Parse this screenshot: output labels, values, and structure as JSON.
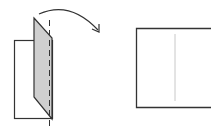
{
  "diagram": {
    "colors": {
      "stroke": "#333333",
      "panel_fill": "#cfcfcf",
      "crease": "#c8c8c8",
      "background": "#ffffff"
    },
    "elements": [
      "back-sheet",
      "folded-flap",
      "fold-line",
      "unfold-arrow",
      "result-sheet",
      "result-crease"
    ]
  }
}
